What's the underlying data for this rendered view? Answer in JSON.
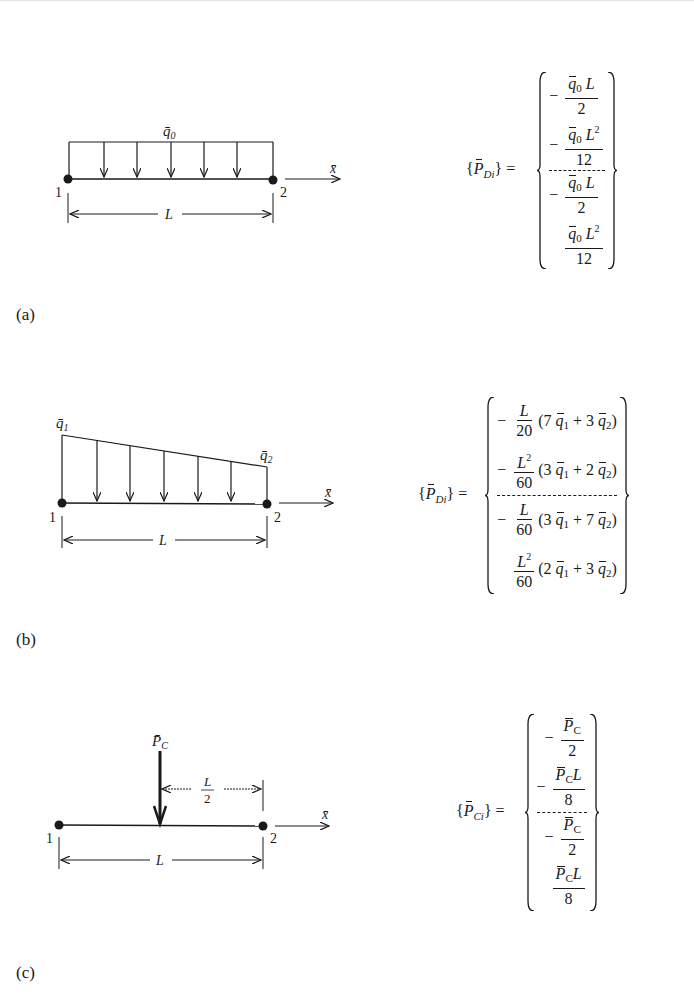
{
  "figure": {
    "panels": [
      {
        "id": "a",
        "label": "(a)",
        "diagram": {
          "load_type": "uniform distributed load",
          "load_label": "q̄",
          "load_sub": "0",
          "node_1": "1",
          "node_2": "2",
          "axis_label": "x̄",
          "length_label": "L"
        },
        "equation": {
          "lhs_symbol": "P",
          "lhs_sub": "Di",
          "lhs_open": "{",
          "lhs_close": "}",
          "equals": "=",
          "rows": [
            {
              "sign": "−",
              "num_q": "q",
              "num_q_sub": "0",
              "num_tail": "L",
              "num_sup": "",
              "den": "2"
            },
            {
              "sign": "−",
              "num_q": "q",
              "num_q_sub": "0",
              "num_tail": "L",
              "num_sup": "2",
              "den": "12"
            },
            {
              "sign": "−",
              "num_q": "q",
              "num_q_sub": "0",
              "num_tail": "L",
              "num_sup": "",
              "den": "2"
            },
            {
              "sign": "",
              "num_q": "q",
              "num_q_sub": "0",
              "num_tail": "L",
              "num_sup": "2",
              "den": "12"
            }
          ]
        }
      },
      {
        "id": "b",
        "label": "(b)",
        "diagram": {
          "load_type": "linearly varying distributed load",
          "load_left_label": "q̄",
          "load_left_sub": "1",
          "load_right_label": "q̄",
          "load_right_sub": "2",
          "node_1": "1",
          "node_2": "2",
          "axis_label": "x̄",
          "length_label": "L"
        },
        "equation": {
          "lhs_symbol": "P",
          "lhs_sub": "Di",
          "lhs_open": "{",
          "lhs_close": "}",
          "equals": "=",
          "rows": [
            {
              "sign": "−",
              "num": "L",
              "num_sup": "",
              "den": "20",
              "paren": [
                "(7 ",
                "q",
                "1",
                " + 3 ",
                "q",
                "2",
                ")"
              ]
            },
            {
              "sign": "−",
              "num": "L",
              "num_sup": "2",
              "den": "60",
              "paren": [
                "(3 ",
                "q",
                "1",
                " + 2 ",
                "q",
                "2",
                ")"
              ]
            },
            {
              "sign": "−",
              "num": "L",
              "num_sup": "",
              "den": "60",
              "paren": [
                "(3 ",
                "q",
                "1",
                " + 7 ",
                "q",
                "2",
                ")"
              ]
            },
            {
              "sign": "",
              "num": "L",
              "num_sup": "2",
              "den": "60",
              "paren": [
                "(2 ",
                "q",
                "1",
                " + 3 ",
                "q",
                "2",
                ")"
              ]
            }
          ]
        }
      },
      {
        "id": "c",
        "label": "(c)",
        "diagram": {
          "load_type": "concentrated load at midspan",
          "load_label": "P̄",
          "load_sub": "C",
          "half_length_num": "L",
          "half_length_den": "2",
          "node_1": "1",
          "node_2": "2",
          "axis_label": "x̄",
          "length_label": "L"
        },
        "equation": {
          "lhs_symbol": "P",
          "lhs_sub": "Ci",
          "lhs_open": "{",
          "lhs_close": "}",
          "equals": "=",
          "rows": [
            {
              "sign": "−",
              "num_p": "P",
              "num_p_sub": "C",
              "num_tail": "",
              "den": "2"
            },
            {
              "sign": "−",
              "num_p": "P",
              "num_p_sub": "C",
              "num_tail": "L",
              "den": "8"
            },
            {
              "sign": "−",
              "num_p": "P",
              "num_p_sub": "C",
              "num_tail": "",
              "den": "2"
            },
            {
              "sign": "",
              "num_p": "P",
              "num_p_sub": "C",
              "num_tail": "L",
              "den": "8"
            }
          ]
        }
      }
    ]
  }
}
